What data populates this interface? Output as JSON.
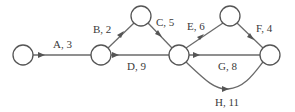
{
  "diagram": {
    "type": "activity-on-arrow network",
    "nodes": [
      {
        "id": "n1",
        "x": 23,
        "y": 55
      },
      {
        "id": "n2",
        "x": 101,
        "y": 55
      },
      {
        "id": "n3",
        "x": 141,
        "y": 16
      },
      {
        "id": "n4",
        "x": 179,
        "y": 55
      },
      {
        "id": "n5",
        "x": 230,
        "y": 16
      },
      {
        "id": "n6",
        "x": 270,
        "y": 55
      }
    ],
    "edges": [
      {
        "id": "A",
        "from": "n1",
        "to": "n2",
        "label": "A, 3"
      },
      {
        "id": "B",
        "from": "n2",
        "to": "n3",
        "label": "B, 2"
      },
      {
        "id": "C",
        "from": "n3",
        "to": "n4",
        "label": "C, 5"
      },
      {
        "id": "D",
        "from": "n2",
        "to": "n4",
        "label": "D, 9"
      },
      {
        "id": "E",
        "from": "n4",
        "to": "n5",
        "label": "E, 6"
      },
      {
        "id": "F",
        "from": "n5",
        "to": "n6",
        "label": "F, 4"
      },
      {
        "id": "G",
        "from": "n4",
        "to": "n6",
        "label": "G, 8"
      },
      {
        "id": "H",
        "from": "n4",
        "to": "n6",
        "label": "H, 11"
      }
    ],
    "colors": {
      "stroke": "#555555",
      "text": "#3a3a3a",
      "background": "#ffffff"
    }
  }
}
